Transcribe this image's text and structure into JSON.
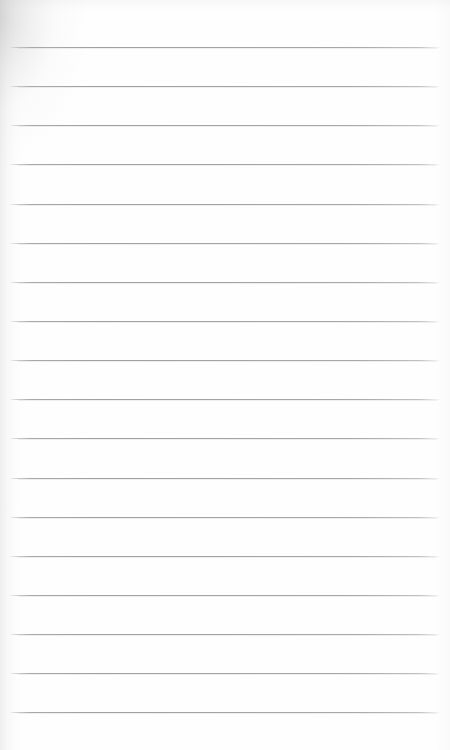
{
  "document": {
    "kind": "blank-lined-notebook-page",
    "title": "",
    "body_text": "",
    "has_text_content": false,
    "page_number": "",
    "header_text": "",
    "footer_text": ""
  },
  "canvas": {
    "width": 450,
    "height": 750,
    "background_color": "#ffffff",
    "paper_color": "#fefefe"
  },
  "ruling": {
    "style": "wide-ruled",
    "line_color": "#a3a3a6",
    "line_thickness_px": 1,
    "line_count": 18,
    "first_line_y": 47,
    "line_spacing_px": 39.1,
    "line_start_x": 9,
    "line_end_x": 441,
    "margin_rule_visible": false,
    "margin_rule_color": "",
    "lines": [
      {
        "index": 1,
        "y": 47,
        "x_start": 9,
        "x_end": 441,
        "text": ""
      },
      {
        "index": 2,
        "y": 86,
        "x_start": 9,
        "x_end": 441,
        "text": ""
      },
      {
        "index": 3,
        "y": 125,
        "x_start": 9,
        "x_end": 441,
        "text": ""
      },
      {
        "index": 4,
        "y": 164,
        "x_start": 9,
        "x_end": 441,
        "text": ""
      },
      {
        "index": 5,
        "y": 204,
        "x_start": 9,
        "x_end": 441,
        "text": ""
      },
      {
        "index": 6,
        "y": 243,
        "x_start": 9,
        "x_end": 441,
        "text": ""
      },
      {
        "index": 7,
        "y": 282,
        "x_start": 9,
        "x_end": 441,
        "text": ""
      },
      {
        "index": 8,
        "y": 321,
        "x_start": 9,
        "x_end": 441,
        "text": ""
      },
      {
        "index": 9,
        "y": 360,
        "x_start": 9,
        "x_end": 441,
        "text": ""
      },
      {
        "index": 10,
        "y": 399,
        "x_start": 9,
        "x_end": 441,
        "text": ""
      },
      {
        "index": 11,
        "y": 438,
        "x_start": 9,
        "x_end": 441,
        "text": ""
      },
      {
        "index": 12,
        "y": 478,
        "x_start": 9,
        "x_end": 441,
        "text": ""
      },
      {
        "index": 13,
        "y": 517,
        "x_start": 9,
        "x_end": 441,
        "text": ""
      },
      {
        "index": 14,
        "y": 556,
        "x_start": 9,
        "x_end": 441,
        "text": ""
      },
      {
        "index": 15,
        "y": 595,
        "x_start": 9,
        "x_end": 441,
        "text": ""
      },
      {
        "index": 16,
        "y": 634,
        "x_start": 9,
        "x_end": 441,
        "text": ""
      },
      {
        "index": 17,
        "y": 673,
        "x_start": 9,
        "x_end": 441,
        "text": ""
      },
      {
        "index": 18,
        "y": 712,
        "x_start": 9,
        "x_end": 441,
        "text": ""
      }
    ]
  },
  "shading": {
    "corner_shadow_color": "#969698",
    "left_edge_shadow_color": "#a0a0a3",
    "top_edge_shadow_color": "#b2b2b5",
    "right_edge_shadow_color": "#c4c4c7"
  },
  "blank_regions": {
    "top_margin_px": 47,
    "bottom_margin_px": 38
  }
}
